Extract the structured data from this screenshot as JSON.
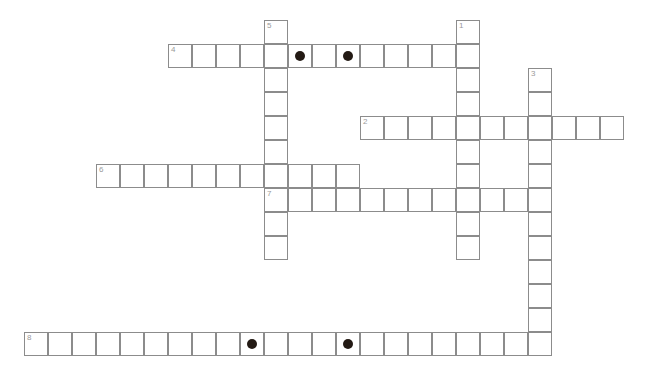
{
  "puzzle": {
    "title": "Crossword Grid",
    "cell_size": 24,
    "origin_x": 24,
    "origin_y": 20,
    "grid_cols": 26,
    "grid_rows": 15,
    "colors": {
      "cell_border": "#8c8c8c",
      "cell_fill": "#ffffff",
      "number": "#9a9a9a",
      "circle_marker": "#231a14",
      "background": "#ffffff"
    },
    "entries": [
      {
        "number": "1",
        "direction": "down",
        "start_col": 18,
        "start_row": 0,
        "length": 10,
        "circles": []
      },
      {
        "number": "2",
        "direction": "across",
        "start_col": 14,
        "start_row": 4,
        "length": 11,
        "circles": []
      },
      {
        "number": "3",
        "direction": "down",
        "start_col": 21,
        "start_row": 2,
        "length": 12,
        "circles": []
      },
      {
        "number": "4",
        "direction": "across",
        "start_col": 6,
        "start_row": 1,
        "length": 13,
        "circles": [
          5,
          7
        ]
      },
      {
        "number": "5",
        "direction": "down",
        "start_col": 10,
        "start_row": 0,
        "length": 10,
        "circles": []
      },
      {
        "number": "6",
        "direction": "across",
        "start_col": 3,
        "start_row": 6,
        "length": 11,
        "circles": []
      },
      {
        "number": "7",
        "direction": "across",
        "start_col": 10,
        "start_row": 7,
        "length": 11,
        "circles": []
      },
      {
        "number": "8",
        "direction": "across",
        "start_col": 0,
        "start_row": 13,
        "length": 22,
        "circles": [
          9,
          13
        ]
      }
    ]
  }
}
